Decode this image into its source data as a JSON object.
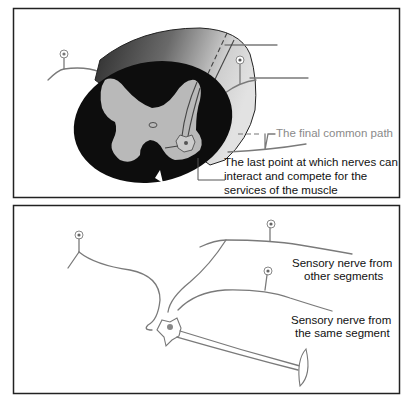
{
  "top_panel": {
    "label_final_path": "The final common path",
    "label_last_point": [
      "The last point at which nerves can",
      "interact and compete for the",
      "services of the muscle"
    ]
  },
  "bottom_panel": {
    "label_other_segments": [
      "Sensory nerve from",
      "other segments"
    ],
    "label_same_segment": [
      "Sensory nerve from",
      "the same segment"
    ]
  },
  "colors": {
    "frame": "#222222",
    "cord_dark": "#0d0d0d",
    "cord_side": "#5a5a5a",
    "grey_matter": "#b9b9b9",
    "nerve": "#7a7a7a",
    "label_grey": "#8a8a8a"
  }
}
